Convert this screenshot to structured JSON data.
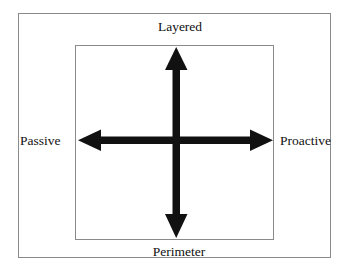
{
  "diagram": {
    "type": "axis-quadrant-diagram",
    "axes": [
      {
        "id": "vertical-axis",
        "orientation": "vertical",
        "positive_end_label": "Layered",
        "negative_end_label": "Perimeter",
        "arrowheads": "double"
      },
      {
        "id": "horizontal-axis",
        "orientation": "horizontal",
        "positive_end_label": "Proactive",
        "negative_end_label": "Passive",
        "arrowheads": "double"
      }
    ],
    "labels": {
      "top": "Layered",
      "bottom": "Perimeter",
      "left": "Passive",
      "right": "Proactive"
    },
    "colors": {
      "arrow": "#111111",
      "frame_border": "#8a8a8a",
      "inner_border": "#8a8a8a",
      "background": "#ffffff",
      "text": "#111111"
    }
  }
}
